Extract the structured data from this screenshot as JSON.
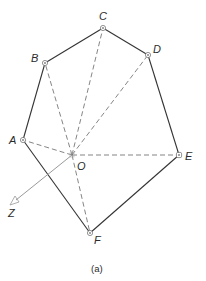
{
  "figure": {
    "caption": "(a)",
    "colors": {
      "solid_edge": "#333333",
      "dashed_edge": "#777777",
      "axis": "#9a9a9a",
      "point": "#555555",
      "label": "#2b2b2b"
    },
    "points": [
      {
        "id": "A",
        "label": "A",
        "x": 23,
        "y": 140
      },
      {
        "id": "B",
        "label": "B",
        "x": 45,
        "y": 63
      },
      {
        "id": "C",
        "label": "C",
        "x": 103,
        "y": 28
      },
      {
        "id": "D",
        "label": "D",
        "x": 148,
        "y": 55
      },
      {
        "id": "E",
        "label": "E",
        "x": 179,
        "y": 155
      },
      {
        "id": "F",
        "label": "F",
        "x": 90,
        "y": 233
      }
    ],
    "center": {
      "id": "O",
      "label": "O",
      "x": 72,
      "y": 155
    },
    "axis": {
      "id": "Z",
      "label": "Z",
      "from": "O",
      "x": 13,
      "y": 203
    },
    "polygon_edges": [
      "A-B",
      "B-C",
      "C-D",
      "D-E",
      "E-F",
      "F-A"
    ],
    "dashed_spokes": [
      "O-A",
      "O-B",
      "O-C",
      "O-D",
      "O-E",
      "O-F"
    ]
  }
}
